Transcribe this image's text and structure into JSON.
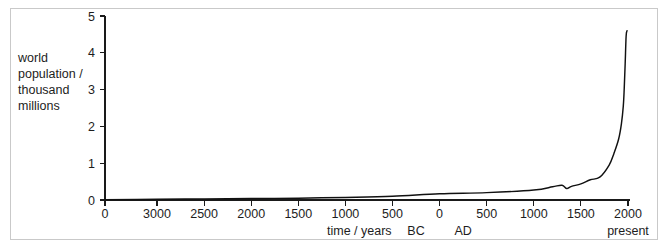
{
  "chart_data": {
    "type": "line",
    "title": "",
    "subtitle": "",
    "xlabel": "time / years",
    "ylabel": "world population / thousand millions",
    "ylabel_lines": [
      "world",
      "population /",
      "thousand",
      "millions"
    ],
    "ylim": [
      0,
      5
    ],
    "y_ticks": [
      0,
      1,
      2,
      3,
      4,
      5
    ],
    "y_tick_labels": [
      "0",
      "1",
      "2",
      "3",
      "4",
      "5"
    ],
    "grid": false,
    "legend": null,
    "legend_position": "none",
    "x_axis_note": "non-uniform axis: leftmost tick labelled 0 (origin), then BC years counting down 3000 to 500, then 0, then AD years 500 to 2000",
    "x_tick_labels": [
      "0",
      "3000",
      "2500",
      "2000",
      "1500",
      "1000",
      "500",
      "0",
      "500",
      "1000",
      "1500",
      "2000"
    ],
    "x_tick_years": [
      -4000,
      -3000,
      -2500,
      -2000,
      -1500,
      -1000,
      -500,
      0,
      500,
      1000,
      1500,
      2000
    ],
    "era_labels": [
      {
        "text": "BC",
        "at_year": -250
      },
      {
        "text": "AD",
        "at_year": 250
      }
    ],
    "present_label": "present",
    "present_at_year": 2000,
    "series": [
      {
        "name": "world population",
        "units": "thousand millions (billions)",
        "points": [
          {
            "year": -4000,
            "value": 0.01
          },
          {
            "year": -3000,
            "value": 0.02
          },
          {
            "year": -2500,
            "value": 0.03
          },
          {
            "year": -2000,
            "value": 0.04
          },
          {
            "year": -1500,
            "value": 0.05
          },
          {
            "year": -1000,
            "value": 0.07
          },
          {
            "year": -500,
            "value": 0.1
          },
          {
            "year": 0,
            "value": 0.17
          },
          {
            "year": 500,
            "value": 0.2
          },
          {
            "year": 1000,
            "value": 0.27
          },
          {
            "year": 1200,
            "value": 0.36
          },
          {
            "year": 1300,
            "value": 0.4
          },
          {
            "year": 1350,
            "value": 0.31
          },
          {
            "year": 1400,
            "value": 0.37
          },
          {
            "year": 1500,
            "value": 0.44
          },
          {
            "year": 1600,
            "value": 0.55
          },
          {
            "year": 1700,
            "value": 0.62
          },
          {
            "year": 1800,
            "value": 0.95
          },
          {
            "year": 1850,
            "value": 1.26
          },
          {
            "year": 1900,
            "value": 1.65
          },
          {
            "year": 1930,
            "value": 2.07
          },
          {
            "year": 1950,
            "value": 2.55
          },
          {
            "year": 1960,
            "value": 3.03
          },
          {
            "year": 1970,
            "value": 3.7
          },
          {
            "year": 1980,
            "value": 4.45
          },
          {
            "year": 1990,
            "value": 4.6
          }
        ],
        "annotation": "sharp dip around 1350 (Black Death), then near-vertical exponential rise to present"
      }
    ],
    "colors": {
      "curve": "#111111",
      "axis": "#1a1a1a",
      "frame": "#c9c9c9",
      "background": "#ffffff",
      "text": "#1d1d1d"
    }
  }
}
